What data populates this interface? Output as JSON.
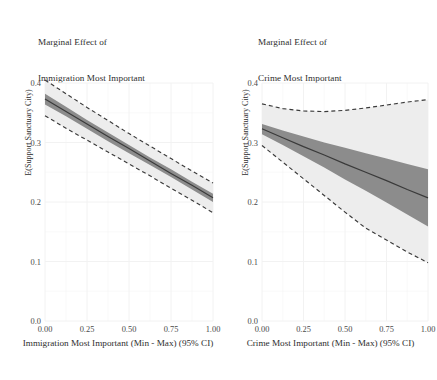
{
  "figure": {
    "background_color": "#ffffff",
    "panel_count": 2
  },
  "chart_data": [
    {
      "type": "line",
      "panel_id": "immigration",
      "title": "Marginal Effect of\nImmigration Most Important",
      "title_line1": "Marginal Effect of",
      "title_line2": "Immigration Most Important",
      "xlabel": "Immigration Most Important (Min - Max) (95% CI)",
      "ylabel": "E(Support Sanctuary City)",
      "xlim": [
        0.0,
        1.0
      ],
      "ylim": [
        0.0,
        0.4
      ],
      "xticks": [
        0.0,
        0.25,
        0.5,
        0.75,
        1.0
      ],
      "xticklabels": [
        "0.00",
        "0.25",
        "0.50",
        "0.75",
        "1.00"
      ],
      "yticks": [
        0.0,
        0.1,
        0.2,
        0.3,
        0.4
      ],
      "yticklabels": [
        "0.0",
        "0.1",
        "0.2",
        "0.3",
        "0.4"
      ],
      "grid": true,
      "grid_color": "#f2f2f2",
      "legend": "none",
      "x": [
        0.0,
        0.125,
        0.25,
        0.375,
        0.5,
        0.625,
        0.75,
        0.875,
        1.0
      ],
      "series": [
        {
          "name": "Point Estimate",
          "style": "solid",
          "color": "#3a3a3a",
          "values": [
            0.373,
            0.352,
            0.331,
            0.31,
            0.29,
            0.269,
            0.248,
            0.228,
            0.207
          ]
        },
        {
          "name": "Inner Band Upper",
          "style": "ribbon-dark-upper",
          "color": "#8a8a8a",
          "values": [
            0.382,
            0.36,
            0.338,
            0.317,
            0.296,
            0.275,
            0.255,
            0.234,
            0.214
          ]
        },
        {
          "name": "Inner Band Lower",
          "style": "ribbon-dark-lower",
          "color": "#8a8a8a",
          "values": [
            0.364,
            0.344,
            0.323,
            0.302,
            0.282,
            0.262,
            0.242,
            0.221,
            0.2
          ]
        },
        {
          "name": "Outer Band Upper (95% CI)",
          "style": "dashed",
          "color": "#3a3a3a",
          "values": [
            0.405,
            0.382,
            0.359,
            0.337,
            0.315,
            0.294,
            0.273,
            0.252,
            0.232
          ]
        },
        {
          "name": "Outer Band Lower (95% CI)",
          "style": "dashed",
          "color": "#3a3a3a",
          "values": [
            0.345,
            0.324,
            0.304,
            0.284,
            0.264,
            0.244,
            0.223,
            0.203,
            0.182
          ]
        }
      ],
      "ribbon_light_color": "#ededed",
      "ribbon_dark_color": "#8c8c8c"
    },
    {
      "type": "line",
      "panel_id": "crime",
      "title": "Marginal Effect of\nCrime Most Important",
      "title_line1": "Marginal Effect of",
      "title_line2": "Crime Most Important",
      "xlabel": "Crime Most Important (Min - Max) (95% CI)",
      "ylabel": "E(Support Sanctuary City)",
      "xlim": [
        0.0,
        1.0
      ],
      "ylim": [
        0.0,
        0.4
      ],
      "xticks": [
        0.0,
        0.25,
        0.5,
        0.75,
        1.0
      ],
      "xticklabels": [
        "0.00",
        "0.25",
        "0.50",
        "0.75",
        "1.00"
      ],
      "yticks": [
        0.0,
        0.1,
        0.2,
        0.3,
        0.4
      ],
      "yticklabels": [
        "0.0",
        "0.1",
        "0.2",
        "0.3",
        "0.4"
      ],
      "grid": true,
      "grid_color": "#f2f2f2",
      "legend": "none",
      "x": [
        0.0,
        0.125,
        0.25,
        0.375,
        0.5,
        0.625,
        0.75,
        0.875,
        1.0
      ],
      "series": [
        {
          "name": "Point Estimate",
          "style": "solid",
          "color": "#3a3a3a",
          "values": [
            0.323,
            0.308,
            0.293,
            0.279,
            0.264,
            0.25,
            0.236,
            0.221,
            0.207
          ]
        },
        {
          "name": "Inner Band Upper",
          "style": "ribbon-dark-upper",
          "color": "#8a8a8a",
          "values": [
            0.331,
            0.32,
            0.31,
            0.3,
            0.291,
            0.282,
            0.273,
            0.264,
            0.255
          ]
        },
        {
          "name": "Inner Band Lower",
          "style": "ribbon-dark-lower",
          "color": "#8a8a8a",
          "values": [
            0.314,
            0.296,
            0.277,
            0.258,
            0.238,
            0.219,
            0.199,
            0.179,
            0.159
          ]
        },
        {
          "name": "Outer Band Upper (95% CI)",
          "style": "dashed",
          "color": "#3a3a3a",
          "values": [
            0.365,
            0.357,
            0.353,
            0.352,
            0.354,
            0.358,
            0.363,
            0.368,
            0.372
          ]
        },
        {
          "name": "Outer Band Lower (95% CI)",
          "style": "dashed",
          "color": "#3a3a3a",
          "values": [
            0.295,
            0.267,
            0.239,
            0.211,
            0.183,
            0.156,
            0.136,
            0.116,
            0.098
          ]
        }
      ],
      "ribbon_light_color": "#ededed",
      "ribbon_dark_color": "#8c8c8c"
    }
  ]
}
